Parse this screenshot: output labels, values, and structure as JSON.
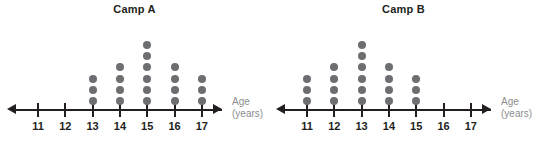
{
  "chart_data": [
    {
      "type": "dot-plot",
      "title": "Camp A",
      "xlabel": "Age (years)",
      "axis_caption_lines": [
        "Age",
        "(years)"
      ],
      "categories": [
        11,
        12,
        13,
        14,
        15,
        16,
        17
      ],
      "tick_labels": [
        "11",
        "12",
        "13",
        "14",
        "15",
        "16",
        "17"
      ],
      "values": [
        0,
        0,
        3,
        4,
        6,
        4,
        3
      ],
      "total_dots": 20,
      "xlim": [
        11,
        17
      ],
      "grid": false,
      "legend": "none",
      "dot_color": "#6d6e71",
      "axis_color": "#231f20",
      "caption_color": "#8d8d8d"
    },
    {
      "type": "dot-plot",
      "title": "Camp B",
      "xlabel": "Age (years)",
      "axis_caption_lines": [
        "Age",
        "(years)"
      ],
      "categories": [
        11,
        12,
        13,
        14,
        15,
        16,
        17
      ],
      "tick_labels": [
        "11",
        "12",
        "13",
        "14",
        "15",
        "16",
        "17"
      ],
      "values": [
        3,
        4,
        6,
        4,
        3,
        0,
        0
      ],
      "total_dots": 20,
      "xlim": [
        11,
        17
      ],
      "grid": false,
      "legend": "none",
      "dot_color": "#6d6e71",
      "axis_color": "#231f20",
      "caption_color": "#8d8d8d"
    }
  ],
  "plots": [
    {
      "id": "camp-a",
      "title": "Camp A",
      "caption_top": "Age",
      "caption_bottom": "(years)"
    },
    {
      "id": "camp-b",
      "title": "Camp B",
      "caption_top": "Age",
      "caption_bottom": "(years)"
    }
  ]
}
